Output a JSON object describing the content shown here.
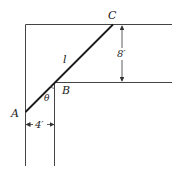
{
  "diagram": {
    "type": "geometry-ladder-corridor",
    "points": {
      "A": "A",
      "B": "B",
      "C": "C"
    },
    "ladder_label": "l",
    "angle_label": "θ",
    "dimensions": {
      "vertical": "8′",
      "horizontal": "4′"
    },
    "colors": {
      "line": "#333333",
      "ladder": "#1a1a1a",
      "background": "#ffffff"
    }
  }
}
